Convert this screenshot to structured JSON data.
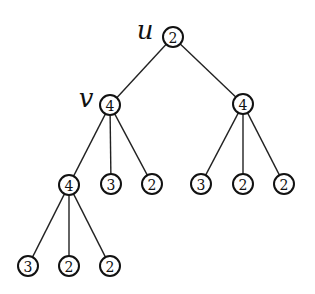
{
  "diagram": {
    "type": "tree",
    "node_radius": 10,
    "nodes": [
      {
        "id": "n0",
        "value": "2",
        "x": 173,
        "y": 37,
        "label": "u"
      },
      {
        "id": "n1",
        "value": "4",
        "x": 110,
        "y": 105,
        "label": "v"
      },
      {
        "id": "n2",
        "value": "4",
        "x": 243,
        "y": 104,
        "label": ""
      },
      {
        "id": "n3",
        "value": "4",
        "x": 69,
        "y": 185,
        "label": ""
      },
      {
        "id": "n4",
        "value": "3",
        "x": 111,
        "y": 184,
        "label": ""
      },
      {
        "id": "n5",
        "value": "2",
        "x": 152,
        "y": 184,
        "label": ""
      },
      {
        "id": "n6",
        "value": "3",
        "x": 201,
        "y": 184,
        "label": ""
      },
      {
        "id": "n7",
        "value": "2",
        "x": 243,
        "y": 184,
        "label": ""
      },
      {
        "id": "n8",
        "value": "2",
        "x": 284,
        "y": 184,
        "label": ""
      },
      {
        "id": "n9",
        "value": "3",
        "x": 28,
        "y": 266,
        "label": ""
      },
      {
        "id": "n10",
        "value": "2",
        "x": 69,
        "y": 266,
        "label": ""
      },
      {
        "id": "n11",
        "value": "2",
        "x": 110,
        "y": 266,
        "label": ""
      }
    ],
    "edges": [
      [
        "n0",
        "n1"
      ],
      [
        "n0",
        "n2"
      ],
      [
        "n1",
        "n3"
      ],
      [
        "n1",
        "n4"
      ],
      [
        "n1",
        "n5"
      ],
      [
        "n2",
        "n6"
      ],
      [
        "n2",
        "n7"
      ],
      [
        "n2",
        "n8"
      ],
      [
        "n3",
        "n9"
      ],
      [
        "n3",
        "n10"
      ],
      [
        "n3",
        "n11"
      ]
    ],
    "labels": [
      {
        "text": "u",
        "node": "n0",
        "x": 145,
        "y": 30
      },
      {
        "text": "v",
        "node": "n1",
        "x": 86,
        "y": 98
      }
    ]
  }
}
